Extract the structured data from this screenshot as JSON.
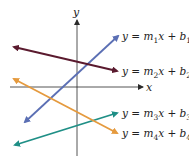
{
  "axes": {
    "x_label": "x",
    "y_label": "y",
    "color": "#2a2a2a"
  },
  "lines": [
    {
      "id": "line1",
      "label": "y = m1x + b1",
      "sub": "1",
      "color": "#5b6fb4",
      "x1": 25,
      "y1": 122,
      "x2": 118,
      "y2": 36,
      "label_x": 122,
      "label_y": 40
    },
    {
      "id": "line2",
      "label": "y = m2x + b2",
      "sub": "2",
      "color": "#5a1a2e",
      "x1": 14,
      "y1": 47,
      "x2": 117,
      "y2": 71,
      "label_x": 122,
      "label_y": 75
    },
    {
      "id": "line3",
      "label": "y = m3x + b3",
      "sub": "3",
      "color": "#1f8f86",
      "x1": 15,
      "y1": 145,
      "x2": 117,
      "y2": 113,
      "label_x": 122,
      "label_y": 117
    },
    {
      "id": "line4",
      "label": "y = m4x + b4",
      "sub": "4",
      "color": "#e59a3e",
      "x1": 14,
      "y1": 79,
      "x2": 117,
      "y2": 133,
      "label_x": 122,
      "label_y": 137
    }
  ]
}
